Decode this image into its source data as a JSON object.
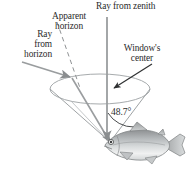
{
  "figure": {
    "background_color": "#ffffff",
    "line_color": "#8f9294",
    "text_color": "#2b2b2b",
    "fish_color": "#b9bdbf"
  },
  "labels": {
    "ray_from_zenith": "Ray from zenith",
    "apparent_horizon": "Apparent\nhorizon",
    "ray_from_horizon": "Ray\nfrom\nhorizon",
    "windows_center": "Window's\ncenter",
    "angle": "48.7°"
  },
  "elements": {
    "window_ellipse": "window-ellipse",
    "cone": "light-cone",
    "zenith_ray": "zenith-ray-arrow",
    "horizon_ray": "horizon-ray-arrow",
    "apparent_horizon_line": "apparent-horizon-dashed-line",
    "window_center_pointer": "window-center-arrow",
    "angle_arc": "angle-arc",
    "fish": "fish-illustration"
  },
  "geometry": {
    "ellipse_center_x": 100,
    "ellipse_center_y": 89,
    "ellipse_rx": 50,
    "ellipse_ry": 15,
    "apex_x": 110,
    "apex_y": 142,
    "half_angle_degrees": 48.7
  }
}
